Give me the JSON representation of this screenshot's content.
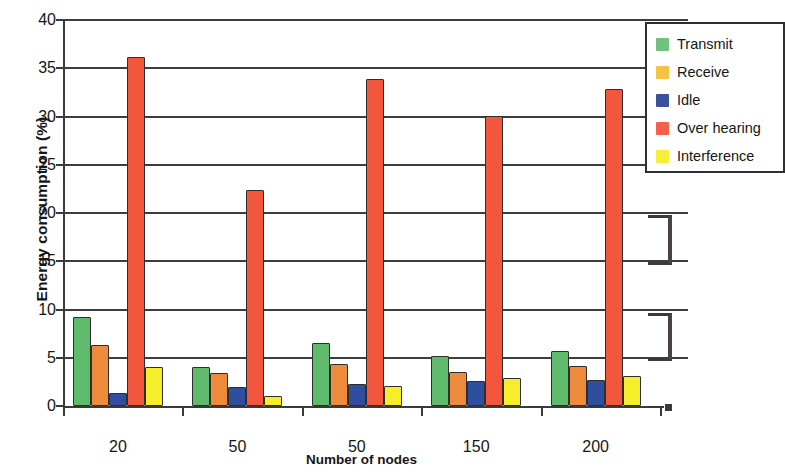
{
  "chart_data": {
    "type": "bar",
    "title": "",
    "xlabel": "Number of nodes",
    "ylabel": "Energy consumption (%)",
    "categories": [
      "20",
      "50",
      "50",
      "150",
      "200"
    ],
    "ylim": [
      0,
      40
    ],
    "yticks": [
      0,
      5,
      10,
      15,
      20,
      25,
      30,
      35,
      40
    ],
    "grid": true,
    "legend_position": "top-right",
    "series": [
      {
        "name": "Transmit",
        "color": "#5FBB6B",
        "values": [
          9.2,
          4.0,
          6.5,
          5.2,
          5.7
        ]
      },
      {
        "name": "Receive",
        "color": "#EE8A3C",
        "legend_color": "#F5C242",
        "values": [
          6.3,
          3.4,
          4.4,
          3.5,
          4.1
        ]
      },
      {
        "name": "Idle",
        "color": "#2F4E9E",
        "values": [
          1.3,
          2.0,
          2.3,
          2.6,
          2.7
        ]
      },
      {
        "name": "Over hearing",
        "color": "#F2563C",
        "values": [
          36.2,
          22.4,
          33.9,
          30.1,
          32.8
        ]
      },
      {
        "name": "Interference",
        "color": "#F6EE2B",
        "values": [
          4.0,
          1.0,
          2.1,
          2.9,
          3.1
        ]
      }
    ]
  },
  "axes": {
    "y_title": "Energy consumption (%)",
    "x_title": "Number of nodes",
    "y_tick_labels": [
      "40",
      "35",
      "30",
      "25",
      "20",
      "15",
      "10",
      "5",
      "0"
    ],
    "x_tick_labels": [
      "20",
      "50",
      "50",
      "150",
      "200"
    ]
  },
  "legend": {
    "items": [
      {
        "label": "Transmit",
        "color": "#72C17C"
      },
      {
        "label": "Receive",
        "color": "#F5C242"
      },
      {
        "label": "Idle",
        "color": "#3A50A0"
      },
      {
        "label": "Over hearing",
        "color": "#F4604A"
      },
      {
        "label": "Interference",
        "color": "#F7EE3A"
      }
    ]
  }
}
